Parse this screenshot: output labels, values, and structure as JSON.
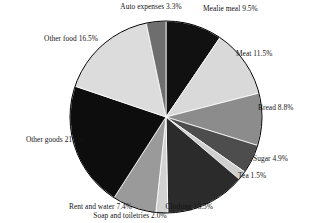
{
  "chart_data": {
    "type": "pie",
    "title": "",
    "subtitle": "",
    "xlabel": "",
    "ylabel": "",
    "legend_position": "none",
    "grid": false,
    "labels_show_percent": true,
    "start_angle_deg": 0,
    "direction": "clockwise",
    "categories": [
      "Mealie meal",
      "Meat",
      "Bread",
      "Sugar",
      "Tea",
      "Clothing",
      "Soap and toiletries",
      "Rent and water",
      "Other goods",
      "Other food",
      "Auto expenses"
    ],
    "values": [
      9.5,
      11.5,
      8.8,
      4.9,
      1.5,
      13.5,
      2.0,
      7.4,
      21.1,
      16.5,
      3.3
    ],
    "units": "percent",
    "total": 100.0,
    "colors": [
      "#111111",
      "#d9d9d9",
      "#8c8c8c",
      "#4d4d4d",
      "#cfcfcf",
      "#2b2b2b",
      "#d2d2d2",
      "#9a9a9a",
      "#0d0d0d",
      "#dcdcdc",
      "#6e6e6e"
    ],
    "slices": [
      {
        "label": "Mealie meal",
        "value": 9.5,
        "text": "Mealie meal 9.5%",
        "color": "#111111"
      },
      {
        "label": "Meat",
        "value": 11.5,
        "text": "Meat 11.5%",
        "color": "#d9d9d9"
      },
      {
        "label": "Bread",
        "value": 8.8,
        "text": "Bread 8.8%",
        "color": "#8c8c8c"
      },
      {
        "label": "Sugar",
        "value": 4.9,
        "text": "Sugar 4.9%",
        "color": "#4d4d4d"
      },
      {
        "label": "Tea",
        "value": 1.5,
        "text": "Tea 1.5%",
        "color": "#cfcfcf"
      },
      {
        "label": "Clothing",
        "value": 13.5,
        "text": "Clothing 13.5%",
        "color": "#2b2b2b"
      },
      {
        "label": "Soap and toiletries",
        "value": 2.0,
        "text": "Soap and toiletries 2.0%",
        "color": "#d2d2d2"
      },
      {
        "label": "Rent and water",
        "value": 7.4,
        "text": "Rent and water 7.4%",
        "color": "#9a9a9a"
      },
      {
        "label": "Other goods",
        "value": 21.1,
        "text": "Other goods 21.1%",
        "color": "#0d0d0d"
      },
      {
        "label": "Other food",
        "value": 16.5,
        "text": "Other food 16.5%",
        "color": "#dcdcdc"
      },
      {
        "label": "Auto expenses",
        "value": 3.3,
        "text": "Auto expenses 3.3%",
        "color": "#6e6e6e"
      }
    ]
  },
  "figure": {
    "background": "#ffffff",
    "outline_color": "#000000",
    "center_x": 166,
    "center_y": 117,
    "radius": 96
  }
}
